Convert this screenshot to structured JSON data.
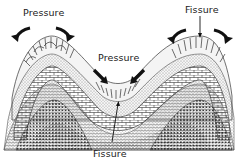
{
  "diagram": {
    "labels": {
      "pressure_top_left": "Pressure",
      "pressure_center": "Pressure",
      "fissure_top_right": "Fissure",
      "fissure_bottom": "Fissure"
    },
    "structures": [
      {
        "name": "anticline-left",
        "crest_x": 50,
        "crest_y": 40
      },
      {
        "name": "syncline-center",
        "trough_x": 118,
        "trough_y": 88
      },
      {
        "name": "anticline-right",
        "crest_x": 200,
        "crest_y": 40
      }
    ],
    "layers": [
      {
        "name": "outer-cleaved-layer",
        "pattern": "radial-lines"
      },
      {
        "name": "fine-stipple-layer",
        "pattern": "fine-dots"
      },
      {
        "name": "brick-layer",
        "pattern": "blocks"
      },
      {
        "name": "hatched-layer",
        "pattern": "wavy-lines"
      },
      {
        "name": "core-coarse-dots",
        "pattern": "coarse-dots"
      }
    ],
    "colors": {
      "ink": "#1a1a1a",
      "background": "#ffffff"
    }
  }
}
